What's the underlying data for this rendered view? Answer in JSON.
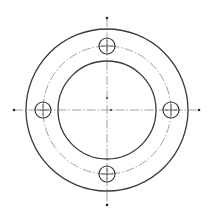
{
  "drawing": {
    "type": "flange-plate-top-view",
    "canvas": {
      "width": 212,
      "height": 219,
      "background": "#ffffff"
    },
    "center": {
      "x": 107,
      "y": 110
    },
    "outer_circle": {
      "r": 81
    },
    "inner_circle": {
      "r": 49
    },
    "bolt_circle": {
      "r": 64,
      "style": "dash-dot"
    },
    "bolt_holes": {
      "count": 4,
      "r": 8,
      "positions": [
        {
          "name": "top",
          "x": 107,
          "y": 46
        },
        {
          "name": "left",
          "x": 43,
          "y": 110
        },
        {
          "name": "right",
          "x": 171,
          "y": 110
        },
        {
          "name": "bottom",
          "x": 107,
          "y": 174
        }
      ]
    },
    "centerlines": {
      "vertical": {
        "x": 107,
        "y1": 18,
        "y2": 205
      },
      "horizontal": {
        "y": 110,
        "x1": 14,
        "x2": 199
      },
      "style": "dash-dot"
    },
    "colors": {
      "outline": "#3a3a3a",
      "centerline": "#8a8a8a"
    }
  }
}
